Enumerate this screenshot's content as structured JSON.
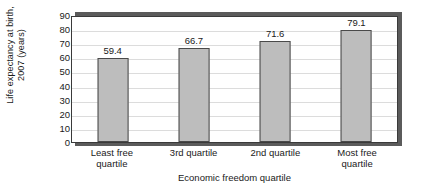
{
  "chart_data": {
    "type": "bar",
    "title": "",
    "categories": [
      "Least free quartile",
      "3rd quartile",
      "2nd quartile",
      "Most free quartile"
    ],
    "category_lines": [
      [
        "Least free",
        "quartile"
      ],
      [
        "3rd quartile",
        ""
      ],
      [
        "2nd quartile",
        ""
      ],
      [
        "Most free",
        "quartile"
      ]
    ],
    "values": [
      59.4,
      66.7,
      71.6,
      79.1
    ],
    "value_labels": [
      "59.4",
      "66.7",
      "71.6",
      "79.1"
    ],
    "xlabel": "Economic freedom quartile",
    "ylabel": "Life expectancy at birth, 2007 (years)",
    "ylabel_lines": [
      "Life expectancy at birth,",
      "2007 (years)"
    ],
    "ylim": [
      0,
      90
    ],
    "ytick_step": 10,
    "ytick_labels": [
      "0",
      "10",
      "20",
      "30",
      "40",
      "50",
      "60",
      "70",
      "80",
      "90"
    ],
    "grid": true,
    "grid_axis": "y",
    "legend": "none",
    "bar_color": "#bdbdbd",
    "bar_border_color": "#4a4a4a",
    "grid_color": "#dcdcdc",
    "frame_color": "#3a3a3a",
    "shadow_color": "#5b5b5b",
    "background_color": "#ffffff",
    "text_color": "#1a1a1a"
  }
}
